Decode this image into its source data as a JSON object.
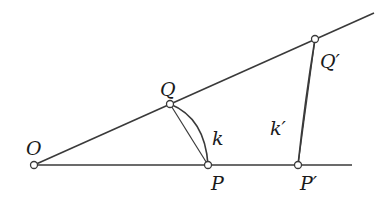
{
  "diagram": {
    "colors": {
      "line": "#3a3a3a",
      "point_fill": "#ffffff",
      "label": "#1a1a1a"
    },
    "points": {
      "O": {
        "label": "O",
        "x": 34,
        "y": 165
      },
      "Q": {
        "label": "Q",
        "x": 170,
        "y": 104
      },
      "P": {
        "label": "P",
        "x": 208,
        "y": 165
      },
      "Q_prime": {
        "label": "Q′",
        "x": 315,
        "y": 39
      },
      "P_prime": {
        "label": "P′",
        "x": 298,
        "y": 165
      }
    },
    "curves": {
      "k": {
        "label": "k"
      },
      "k_prime": {
        "label": "k′"
      }
    }
  }
}
